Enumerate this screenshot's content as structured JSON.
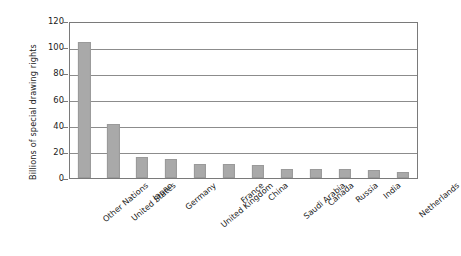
{
  "chart_data": {
    "type": "bar",
    "title": "",
    "xlabel": "",
    "ylabel": "Billions of special drawing rights",
    "ylim": [
      0,
      120
    ],
    "yticks": [
      0,
      20,
      40,
      60,
      80,
      100,
      120
    ],
    "ytick_labels": [
      "0",
      "20",
      "40",
      "60",
      "80",
      "100",
      "120"
    ],
    "grid": "horizontal",
    "legend": "none",
    "bar_color": "#a9a9a9",
    "categories": [
      "Other Nations",
      "United States",
      "Japan",
      "Germany",
      "United Kingdom",
      "France",
      "China",
      "Saudi Arabia",
      "Canada",
      "Russia",
      "India",
      "Netherlands"
    ],
    "values": [
      105,
      42,
      16,
      15,
      11,
      11,
      10,
      7,
      7,
      7,
      6,
      5
    ]
  }
}
